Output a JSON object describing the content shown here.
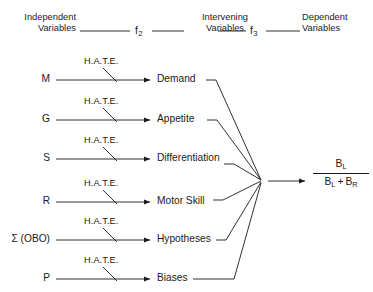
{
  "figure": {
    "background_color": "#ffffff",
    "line_color": "#1a1a1a",
    "text_color": "#1a1a1a"
  },
  "headers": {
    "independent": {
      "line1": "Independent",
      "line2": "Variables"
    },
    "intervening": {
      "line1": "Intervening",
      "line2": "Variables"
    },
    "dependent": {
      "line1": "Dependent",
      "line2": "Variables"
    }
  },
  "functions": {
    "f2": {
      "base": "f",
      "sub": "2"
    },
    "f3": {
      "base": "f",
      "sub": "3"
    }
  },
  "operator_label": "H.A.T.E.",
  "rows": [
    {
      "independent": "M",
      "operator": "H.A.T.E.",
      "intervening": "Demand"
    },
    {
      "independent": "G",
      "operator": "H.A.T.E.",
      "intervening": "Appetite"
    },
    {
      "independent": "S",
      "operator": "H.A.T.E.",
      "intervening": "Differentiation"
    },
    {
      "independent": "R",
      "operator": "H.A.T.E.",
      "intervening": "Motor Skill"
    },
    {
      "independent": "Σ (OBO)",
      "operator": "H.A.T.E.",
      "intervening": "Hypotheses"
    },
    {
      "independent": "P",
      "operator": "H.A.T.E.",
      "intervening": "Biases"
    }
  ],
  "dependent_variable": {
    "numerator": {
      "base": "B",
      "sub": "L"
    },
    "denominator": {
      "left": {
        "base": "B",
        "sub": "L"
      },
      "operator": "+",
      "right": {
        "base": "B",
        "sub": "R"
      }
    }
  }
}
